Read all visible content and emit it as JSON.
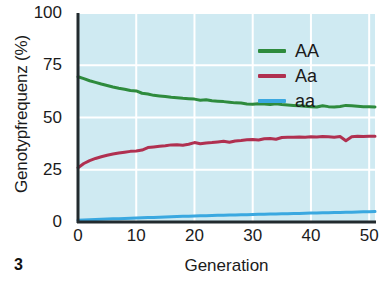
{
  "figure": {
    "number": "3"
  },
  "chart_data": {
    "type": "line",
    "title": "",
    "xlabel": "Generation",
    "ylabel": "Genotypfrequenz (%)",
    "xlim": [
      0,
      51
    ],
    "ylim": [
      0,
      100
    ],
    "xticks": [
      0,
      10,
      20,
      30,
      40,
      50
    ],
    "yticks": [
      0,
      25,
      50,
      75,
      100
    ],
    "xtick_labels": [
      "0",
      "10",
      "20",
      "30",
      "40",
      "50"
    ],
    "ytick_labels": [
      "0",
      "25",
      "50",
      "75",
      "100"
    ],
    "grid": true,
    "grid_color": "#ffffff",
    "plot_background": "#cfeaf2",
    "legend_position": "top-right",
    "x": [
      0,
      1,
      2,
      3,
      4,
      5,
      6,
      7,
      8,
      9,
      10,
      11,
      12,
      13,
      14,
      15,
      16,
      17,
      18,
      19,
      20,
      21,
      22,
      23,
      24,
      25,
      26,
      27,
      28,
      29,
      30,
      31,
      32,
      33,
      34,
      35,
      36,
      37,
      38,
      39,
      40,
      41,
      42,
      43,
      44,
      45,
      46,
      47,
      48,
      49,
      50,
      51
    ],
    "series": [
      {
        "name": "AA",
        "color": "#2e8b3d",
        "values": [
          69.5,
          68.6,
          67.6,
          66.8,
          66.0,
          65.3,
          64.6,
          64.0,
          63.5,
          62.9,
          62.7,
          61.6,
          61.2,
          60.6,
          60.3,
          60.0,
          59.7,
          59.5,
          59.2,
          59.0,
          58.8,
          58.3,
          58.5,
          58.0,
          57.8,
          57.6,
          57.3,
          57.0,
          56.9,
          56.5,
          56.3,
          56.6,
          56.4,
          56.2,
          56.6,
          56.2,
          56.0,
          55.8,
          55.6,
          55.4,
          55.2,
          55.0,
          55.6,
          55.2,
          55.0,
          55.3,
          55.8,
          55.6,
          55.4,
          55.2,
          55.1,
          55.0
        ]
      },
      {
        "name": "Aa",
        "color": "#b03050",
        "values": [
          26.0,
          28.0,
          29.4,
          30.4,
          31.2,
          31.9,
          32.5,
          33.0,
          33.4,
          33.8,
          34.0,
          34.4,
          35.6,
          35.9,
          36.2,
          36.5,
          36.9,
          37.0,
          36.7,
          37.2,
          38.0,
          37.4,
          37.8,
          38.0,
          38.3,
          38.6,
          38.2,
          38.8,
          39.0,
          39.3,
          39.5,
          39.2,
          39.8,
          40.0,
          39.6,
          40.4,
          40.6,
          40.5,
          40.7,
          40.6,
          40.8,
          40.7,
          40.9,
          40.8,
          40.6,
          40.9,
          38.9,
          40.8,
          41.0,
          40.9,
          41.0,
          41.0
        ]
      },
      {
        "name": "aa",
        "color": "#3aa8e0",
        "values": [
          0.8,
          1.0,
          1.1,
          1.2,
          1.3,
          1.4,
          1.5,
          1.6,
          1.7,
          1.8,
          1.9,
          2.0,
          2.1,
          2.2,
          2.3,
          2.4,
          2.5,
          2.6,
          2.7,
          2.8,
          2.9,
          3.0,
          3.05,
          3.1,
          3.2,
          3.25,
          3.3,
          3.4,
          3.45,
          3.5,
          3.6,
          3.65,
          3.7,
          3.8,
          3.85,
          3.9,
          4.0,
          4.05,
          4.1,
          4.2,
          4.25,
          4.3,
          4.4,
          4.45,
          4.5,
          4.6,
          4.65,
          4.7,
          4.8,
          4.85,
          4.9,
          5.0
        ]
      }
    ],
    "legend": [
      {
        "label": "AA",
        "color": "#2e8b3d"
      },
      {
        "label": "Aa",
        "color": "#b03050"
      },
      {
        "label": "aa",
        "color": "#3aa8e0"
      }
    ]
  }
}
